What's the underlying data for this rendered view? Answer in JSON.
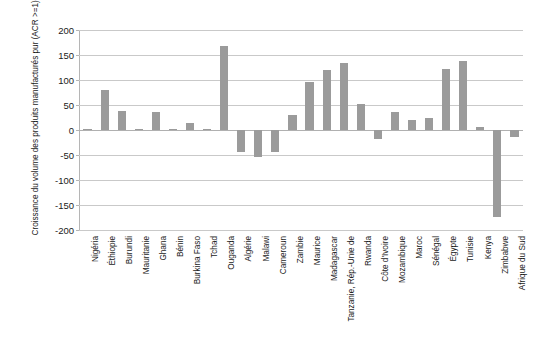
{
  "chart_data": {
    "type": "bar",
    "title": "",
    "xlabel": "",
    "ylabel": "Croissance du volume des produits manufacturés pur (ACR >=1), 1995-2013",
    "ylim": [
      -200,
      200
    ],
    "yticks": [
      200,
      150,
      100,
      50,
      0,
      -50,
      -100,
      -150,
      -200
    ],
    "ytick_labels": [
      "200",
      "150",
      "100",
      "50",
      "0",
      "-50",
      "-100",
      "-150",
      "-200"
    ],
    "grid": true,
    "legend": "none",
    "bar_color": "#9b9b9b",
    "categories": [
      "Nigéria",
      "Éthiopie",
      "Burundi",
      "Mauritanie",
      "Ghana",
      "Bénin",
      "Burkina Faso",
      "Tchad",
      "Ouganda",
      "Algérie",
      "Malawi",
      "Cameroun",
      "Zambie",
      "Maurice",
      "Madagascar",
      "Tanzanie, Rép.-Unie de",
      "Rwanda",
      "Côte d'Ivoire",
      "Mozambique",
      "Maroc",
      "Sénégal",
      "Égypte",
      "Tunisie",
      "Kenya",
      "Zimbabwe",
      "Afrique du Sud"
    ],
    "values": [
      3,
      80,
      38,
      2,
      36,
      3,
      14,
      2,
      168,
      -43,
      -54,
      -44,
      30,
      96,
      120,
      135,
      52,
      -18,
      36,
      20,
      24,
      122,
      138,
      6,
      -174,
      -14
    ]
  }
}
